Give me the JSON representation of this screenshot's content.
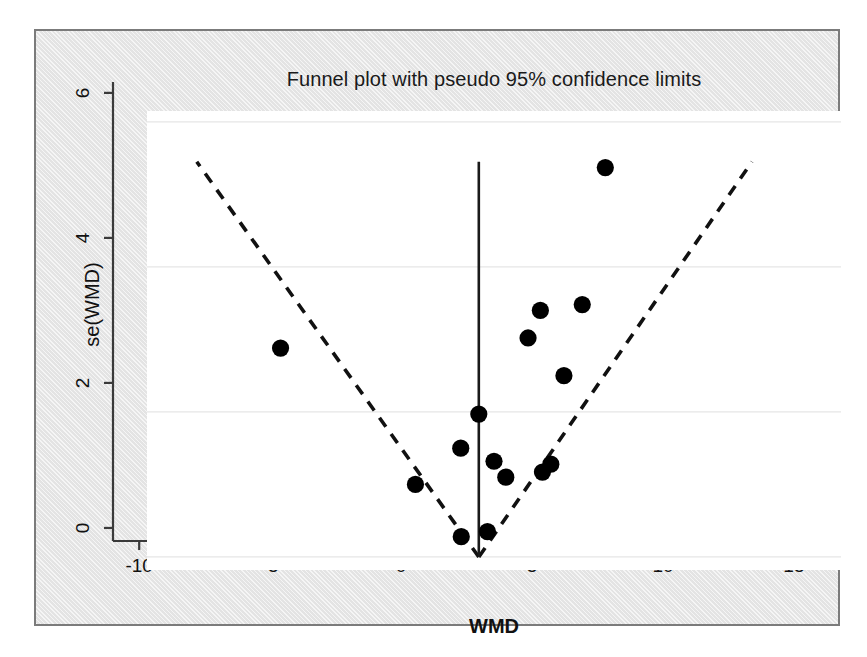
{
  "chart_data": {
    "type": "scatter",
    "title": "Funnel plot with pseudo 95% confidence limits",
    "xlabel": "WMD",
    "ylabel": "se(WMD)",
    "xlim": [
      -11.0,
      15.5
    ],
    "ylim": [
      6.15,
      -0.18
    ],
    "y_axis_inverted": true,
    "grid": "horizontal",
    "legend_position": "none",
    "xticks": [
      -10,
      -5,
      0,
      5,
      10,
      15
    ],
    "xtick_labels": [
      "-10",
      "-5",
      "0",
      "5",
      "10",
      "15"
    ],
    "yticks": [
      0,
      2,
      4,
      6
    ],
    "ytick_labels": [
      "0",
      "2",
      "4",
      "6"
    ],
    "series": [
      {
        "name": "studies",
        "marker": "filled-circle",
        "color": "#000000",
        "points": [
          {
            "x": 1.0,
            "y": 0.28
          },
          {
            "x": 2.0,
            "y": 0.35
          },
          {
            "x": -0.75,
            "y": 1.0
          },
          {
            "x": 2.7,
            "y": 1.1
          },
          {
            "x": 4.1,
            "y": 1.17
          },
          {
            "x": 4.42,
            "y": 1.28
          },
          {
            "x": 2.25,
            "y": 1.32
          },
          {
            "x": 0.98,
            "y": 1.5
          },
          {
            "x": 1.67,
            "y": 1.97
          },
          {
            "x": 4.92,
            "y": 2.5
          },
          {
            "x": -5.9,
            "y": 2.88
          },
          {
            "x": 3.55,
            "y": 3.02
          },
          {
            "x": 4.02,
            "y": 3.4
          },
          {
            "x": 5.62,
            "y": 3.48
          },
          {
            "x": 6.5,
            "y": 5.37
          }
        ]
      }
    ],
    "reference_line": {
      "name": "pooled-effect",
      "style": "solid",
      "x": 1.67,
      "y_from": 0.0,
      "y_to": 5.45,
      "color": "#1a1a1a"
    },
    "confidence_limits": {
      "name": "pseudo 95% confidence limits",
      "style": "dashed",
      "color": "#111111",
      "apex": {
        "x": 1.67,
        "y": 0.0
      },
      "left_end": {
        "x": -9.1,
        "y": 5.45
      },
      "right_end": {
        "x": 12.1,
        "y": 5.45
      }
    }
  }
}
